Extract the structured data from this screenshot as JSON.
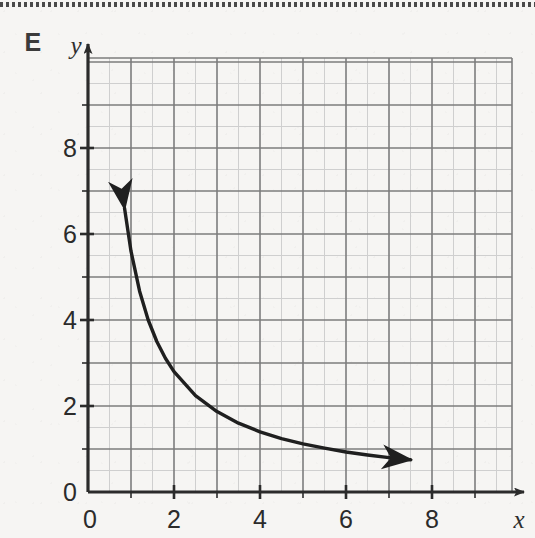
{
  "figure": {
    "panel_label": "E",
    "background_color": "#f6f5f3",
    "top_rule": "dotted-separator"
  },
  "chart_data": {
    "type": "line",
    "title": "",
    "subtitle": "",
    "xlabel": "x",
    "ylabel": "y",
    "xlim": [
      0,
      9.85
    ],
    "ylim": [
      0,
      10.1
    ],
    "xticks_major": [
      0,
      2,
      4,
      6,
      8
    ],
    "yticks_major": [
      0,
      2,
      4,
      6,
      8
    ],
    "xticklabels": [
      "0",
      "2",
      "4",
      "6",
      "8"
    ],
    "yticklabels": [
      "0",
      "2",
      "4",
      "6",
      "8"
    ],
    "minor_tick_step": 1,
    "grid": true,
    "grid_major_step": 1,
    "grid_minor_step": 0.5,
    "grid_major_color": "#787878",
    "grid_minor_color": "#c8c8c8",
    "axis_color": "#2b2b2b",
    "legend": null,
    "annotations": [],
    "series": [
      {
        "name": "inverse-proportion-curve",
        "relationship": "y is inversely proportional to x (y = k/x, k ≈ 5.6)",
        "color": "#1f1f1f",
        "linewidth": 3.4,
        "arrow_start": true,
        "arrow_end": true,
        "x": [
          0.85,
          1.0,
          1.2,
          1.4,
          1.6,
          1.8,
          2.0,
          2.5,
          3.0,
          3.5,
          4.0,
          4.5,
          5.0,
          5.5,
          6.0,
          6.5,
          7.0,
          7.5
        ],
        "y": [
          6.6,
          5.6,
          4.67,
          4.0,
          3.5,
          3.11,
          2.8,
          2.24,
          1.87,
          1.6,
          1.4,
          1.24,
          1.12,
          1.02,
          0.93,
          0.86,
          0.8,
          0.75
        ]
      }
    ]
  }
}
